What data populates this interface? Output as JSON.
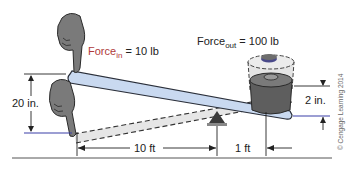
{
  "diagram": {
    "labels": {
      "force_in": {
        "prefix": "Force",
        "subscript": "in",
        "suffix": " = 10 lb"
      },
      "force_out": {
        "prefix": "Force",
        "subscript": "out",
        "suffix": " = 100 lb"
      },
      "input_travel": "20 in.",
      "output_travel": "2 in.",
      "effort_arm": "10 ft",
      "load_arm": "1 ft",
      "copyright": "© Cengage Learning 2014"
    },
    "colors": {
      "lever_fill": "#c9d9f0",
      "lever_stroke": "#2a2f3a",
      "ghost_fill": "#e6e6e6",
      "hand": "#7a7a7a",
      "weight": "#5e5e5e",
      "fulcrum": "#3a3a3a",
      "blue_line": "#3b3fa8",
      "dim_line": "#222222",
      "force_in_text": "#b03a3a"
    }
  }
}
